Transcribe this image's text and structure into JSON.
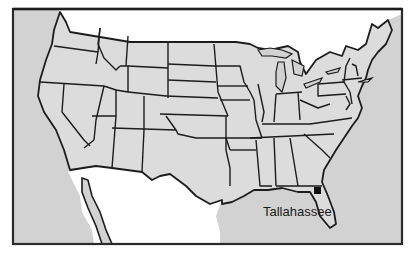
{
  "map": {
    "title": "Map of the contiguous United States",
    "region": "United States (lower 48)",
    "colors": {
      "land": "#dcdcdc",
      "ocean": "#d2d2d2",
      "foreign_land": "#ffffff",
      "border": "#1c1c1c",
      "frame": "#2a2a2a",
      "marker": "#111111"
    },
    "markers": [
      {
        "name": "Tallahassee",
        "label": "Tallahassee",
        "x": 318,
        "y": 191,
        "type": "city-square"
      }
    ]
  }
}
